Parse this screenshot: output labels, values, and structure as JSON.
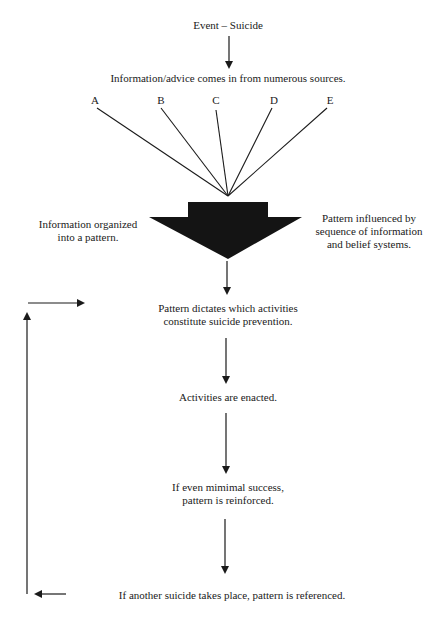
{
  "diagram": {
    "event": "Event – Suicide",
    "sources_text": "Information/advice comes in from numerous sources.",
    "sources": [
      "A",
      "B",
      "C",
      "D",
      "E"
    ],
    "left_note": [
      "Information organized",
      "into a pattern."
    ],
    "right_note": [
      "Pattern influenced by",
      "sequence of information",
      "and belief systems."
    ],
    "step_pattern": [
      "Pattern dictates which activities",
      "constitute suicide prevention."
    ],
    "step_enacted": "Activities are enacted.",
    "step_reinforced": [
      "If even mimimal success,",
      "pattern is reinforced."
    ],
    "step_referenced": "If another suicide takes place, pattern is referenced.",
    "colors": {
      "ink": "#1a1a1a",
      "background": "#ffffff"
    }
  }
}
